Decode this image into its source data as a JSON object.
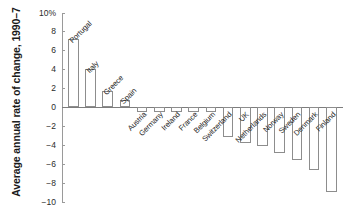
{
  "chart_data": {
    "type": "bar",
    "title": "",
    "xlabel": "",
    "ylabel": "Average annual rate of change, 1990–7",
    "ylim": [
      -10,
      10
    ],
    "grid": false,
    "legend": null,
    "ytick_labels": [
      "10%",
      "8",
      "6",
      "4",
      "2",
      "0",
      "−2",
      "−4",
      "−6",
      "−8",
      "−10"
    ],
    "ytick_values": [
      10,
      8,
      6,
      4,
      2,
      0,
      -2,
      -4,
      -6,
      -8,
      -10
    ],
    "categories": [
      "Portugal",
      "Italy",
      "Greece",
      "Spain",
      "Austria",
      "Germany",
      "Ireland",
      "France",
      "Belgium",
      "Switzerland",
      "UK",
      "Netherlands",
      "Norway",
      "Sweden",
      "Denmark",
      "Finland"
    ],
    "values": [
      7.2,
      4.0,
      1.7,
      0.7,
      -0.5,
      -0.5,
      -0.5,
      -0.5,
      -0.5,
      -3.2,
      -3.8,
      -4.1,
      -4.9,
      -5.6,
      -6.7,
      -9.0
    ],
    "bar_fill": "#ffffff",
    "bar_stroke": "#8d8d8d",
    "axis_color": "#9a9a9a",
    "label_rotation_deg": -45
  }
}
